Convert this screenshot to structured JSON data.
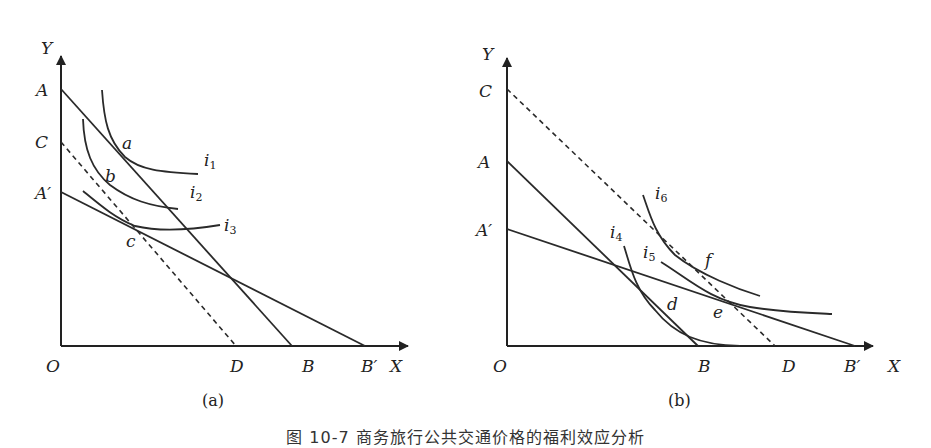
{
  "figure": {
    "caption": "图 10-7  商务旅行公共交通价格的福利效应分析",
    "panels": [
      {
        "id": "a",
        "label": "(a)",
        "axis": {
          "x": "X",
          "y": "Y",
          "origin": "O"
        },
        "y_intercepts": [
          "A",
          "C",
          "A′"
        ],
        "x_intercepts": [
          "D",
          "B",
          "B′"
        ],
        "budget_lines": [
          {
            "name": "AB",
            "style": "solid"
          },
          {
            "name": "A′B′",
            "style": "solid"
          },
          {
            "name": "CD",
            "style": "dashed"
          }
        ],
        "indifference_curves": [
          {
            "name": "i",
            "sub": "1"
          },
          {
            "name": "i",
            "sub": "2"
          },
          {
            "name": "i",
            "sub": "3"
          }
        ],
        "points": [
          "a",
          "b",
          "c"
        ]
      },
      {
        "id": "b",
        "label": "(b)",
        "axis": {
          "x": "X",
          "y": "Y",
          "origin": "O"
        },
        "y_intercepts": [
          "C",
          "A",
          "A′"
        ],
        "x_intercepts": [
          "B",
          "D",
          "B′"
        ],
        "budget_lines": [
          {
            "name": "AB",
            "style": "solid"
          },
          {
            "name": "A′B′",
            "style": "solid"
          },
          {
            "name": "CD",
            "style": "dashed"
          }
        ],
        "indifference_curves": [
          {
            "name": "i",
            "sub": "4"
          },
          {
            "name": "i",
            "sub": "5"
          },
          {
            "name": "i",
            "sub": "6"
          }
        ],
        "points": [
          "d",
          "e",
          "f"
        ]
      }
    ]
  }
}
